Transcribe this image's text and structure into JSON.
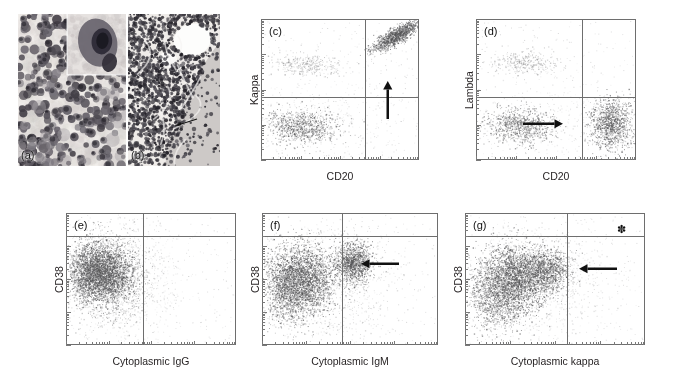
{
  "figure": {
    "background": "#ffffff",
    "axis_color": "#6e6e6e",
    "dot_color": "#6d6d6d",
    "ink_color": "#111111"
  },
  "panels": [
    {
      "id": "a",
      "tag": "(a)",
      "type": "micrograph",
      "description": "cytology smear with inset of large plasmacytoid cell",
      "x": 18,
      "y": 14,
      "w": 108,
      "h": 152
    },
    {
      "id": "b",
      "tag": "(b)",
      "type": "micrograph",
      "description": "histology section of lymphoid infiltrate",
      "x": 128,
      "y": 14,
      "w": 92,
      "h": 152,
      "marker": "thin-arrow"
    },
    {
      "id": "c",
      "tag": "(c)",
      "type": "scatter",
      "xlabel": "CD20",
      "ylabel": "Kappa",
      "x": 261,
      "y": 19,
      "w": 158,
      "h": 141,
      "quadrant_x_frac": 0.66,
      "quadrant_y_frac": 0.555,
      "arrow": {
        "direction": "up",
        "x_frac": 0.8,
        "y_frac": 0.44,
        "length": 38
      },
      "asterisk": null,
      "clusters": [
        {
          "cx": 0.28,
          "cy": 0.32,
          "sx": 0.105,
          "sy": 0.042,
          "n": 340,
          "dark": 0.45,
          "corr": 0.1
        },
        {
          "cx": 0.26,
          "cy": 0.76,
          "sx": 0.115,
          "sy": 0.06,
          "n": 900,
          "dark": 0.8,
          "corr": 0.15
        },
        {
          "cx": 0.855,
          "cy": 0.115,
          "sx": 0.075,
          "sy": 0.055,
          "n": 1150,
          "dark": 0.95,
          "corr": -0.82
        },
        {
          "cx": 0.45,
          "cy": 0.7,
          "sx": 0.3,
          "sy": 0.2,
          "n": 260,
          "dark": 0.2,
          "corr": 0.0
        }
      ]
    },
    {
      "id": "d",
      "tag": "(d)",
      "type": "scatter",
      "xlabel": "CD20",
      "ylabel": "Lambda",
      "x": 476,
      "y": 19,
      "w": 160,
      "h": 141,
      "quadrant_x_frac": 0.665,
      "quadrant_y_frac": 0.555,
      "arrow": {
        "direction": "right",
        "x_frac": 0.545,
        "y_frac": 0.745,
        "length": 40
      },
      "asterisk": null,
      "clusters": [
        {
          "cx": 0.31,
          "cy": 0.305,
          "sx": 0.105,
          "sy": 0.04,
          "n": 330,
          "dark": 0.45,
          "corr": 0.05
        },
        {
          "cx": 0.275,
          "cy": 0.755,
          "sx": 0.11,
          "sy": 0.062,
          "n": 880,
          "dark": 0.78,
          "corr": 0.1
        },
        {
          "cx": 0.845,
          "cy": 0.745,
          "sx": 0.065,
          "sy": 0.09,
          "n": 1050,
          "dark": 0.92,
          "corr": 0.05
        },
        {
          "cx": 0.5,
          "cy": 0.72,
          "sx": 0.3,
          "sy": 0.19,
          "n": 240,
          "dark": 0.18,
          "corr": 0.0
        }
      ]
    },
    {
      "id": "e",
      "tag": "(e)",
      "type": "scatter",
      "xlabel": "Cytoplasmic IgG",
      "ylabel": "CD38",
      "x": 66,
      "y": 213,
      "w": 170,
      "h": 132,
      "quadrant_x_frac": 0.455,
      "quadrant_y_frac": 0.175,
      "arrow": null,
      "asterisk": null,
      "clusters": [
        {
          "cx": 0.225,
          "cy": 0.455,
          "sx": 0.085,
          "sy": 0.115,
          "n": 2600,
          "dark": 0.95,
          "corr": 0.05
        },
        {
          "cx": 0.135,
          "cy": 0.45,
          "sx": 0.055,
          "sy": 0.11,
          "n": 900,
          "dark": 0.85,
          "corr": 0.0
        },
        {
          "cx": 0.26,
          "cy": 0.5,
          "sx": 0.15,
          "sy": 0.2,
          "n": 1200,
          "dark": 0.45,
          "corr": 0.0
        },
        {
          "cx": 0.42,
          "cy": 0.52,
          "sx": 0.17,
          "sy": 0.22,
          "n": 400,
          "dark": 0.18,
          "corr": 0.0
        }
      ]
    },
    {
      "id": "f",
      "tag": "(f)",
      "type": "scatter",
      "xlabel": "Cytoplasmic IgM",
      "ylabel": "CD38",
      "x": 262,
      "y": 213,
      "w": 176,
      "h": 132,
      "quadrant_x_frac": 0.455,
      "quadrant_y_frac": 0.175,
      "arrow": {
        "direction": "left",
        "x_frac": 0.565,
        "y_frac": 0.385,
        "length": 38
      },
      "asterisk": null,
      "clusters": [
        {
          "cx": 0.225,
          "cy": 0.5,
          "sx": 0.09,
          "sy": 0.13,
          "n": 2400,
          "dark": 0.95,
          "corr": 0.05
        },
        {
          "cx": 0.135,
          "cy": 0.6,
          "sx": 0.065,
          "sy": 0.13,
          "n": 800,
          "dark": 0.8,
          "corr": 0.1
        },
        {
          "cx": 0.515,
          "cy": 0.375,
          "sx": 0.05,
          "sy": 0.075,
          "n": 1100,
          "dark": 0.92,
          "corr": 0.0
        },
        {
          "cx": 0.4,
          "cy": 0.52,
          "sx": 0.19,
          "sy": 0.22,
          "n": 900,
          "dark": 0.3,
          "corr": 0.0
        }
      ]
    },
    {
      "id": "g",
      "tag": "(g)",
      "type": "scatter",
      "xlabel": "Cytoplasmic kappa",
      "ylabel": "CD38",
      "x": 465,
      "y": 213,
      "w": 180,
      "h": 132,
      "quadrant_x_frac": 0.565,
      "quadrant_y_frac": 0.175,
      "arrow": {
        "direction": "left",
        "x_frac": 0.635,
        "y_frac": 0.425,
        "length": 38
      },
      "asterisk": {
        "x_frac": 0.845,
        "y_frac": 0.085,
        "glyph": "✽"
      },
      "clusters": [
        {
          "cx": 0.265,
          "cy": 0.495,
          "sx": 0.09,
          "sy": 0.125,
          "n": 2300,
          "dark": 0.95,
          "corr": 0.05
        },
        {
          "cx": 0.155,
          "cy": 0.64,
          "sx": 0.075,
          "sy": 0.13,
          "n": 900,
          "dark": 0.78,
          "corr": 0.25
        },
        {
          "cx": 0.445,
          "cy": 0.43,
          "sx": 0.065,
          "sy": 0.085,
          "n": 1100,
          "dark": 0.9,
          "corr": 0.0
        },
        {
          "cx": 0.4,
          "cy": 0.52,
          "sx": 0.2,
          "sy": 0.23,
          "n": 900,
          "dark": 0.28,
          "corr": 0.0
        }
      ]
    }
  ]
}
